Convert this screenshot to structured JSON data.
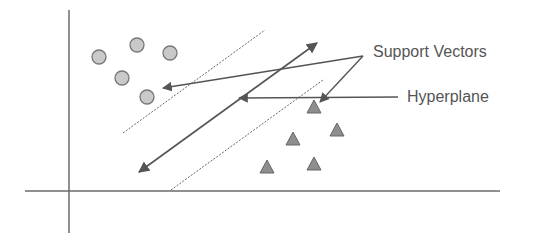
{
  "diagram": {
    "labels": {
      "support_vectors": "Support Vectors",
      "hyperplane": "Hyperplane"
    },
    "colors": {
      "axis": "#6b6b6b",
      "line": "#555555",
      "circle_fill": "#c9c9c9",
      "circle_stroke": "#777777",
      "triangle_fill": "#8e8e8e",
      "triangle_stroke": "#666666",
      "text": "#555555"
    },
    "class_a_circles": [
      {
        "x": 99,
        "y": 57
      },
      {
        "x": 137,
        "y": 45
      },
      {
        "x": 170,
        "y": 53
      },
      {
        "x": 122,
        "y": 78
      },
      {
        "x": 147,
        "y": 97
      }
    ],
    "class_b_triangles": [
      {
        "x": 314,
        "y": 107
      },
      {
        "x": 293,
        "y": 139
      },
      {
        "x": 337,
        "y": 130
      },
      {
        "x": 267,
        "y": 167
      },
      {
        "x": 314,
        "y": 164
      }
    ]
  }
}
